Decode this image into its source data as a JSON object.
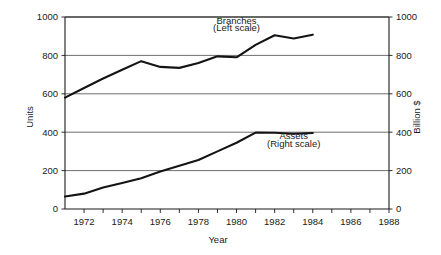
{
  "chart_data": {
    "type": "line",
    "title": "",
    "xlabel": "Year",
    "ylabel": "Units",
    "y2label": "Billion $",
    "grid": true,
    "legend_position": "inline-annotation",
    "xlim": [
      1971,
      1988
    ],
    "ylim": [
      0,
      1000
    ],
    "y2lim": [
      0,
      1000
    ],
    "xticks": [
      1972,
      1974,
      1976,
      1978,
      1980,
      1982,
      1984,
      1986,
      1988
    ],
    "xtick_labels": [
      "1972",
      "1974",
      "1976",
      "1978",
      "1980",
      "1982",
      "1984",
      "1986",
      "1988"
    ],
    "xtick_minor": [
      1971,
      1973,
      1975,
      1977,
      1979,
      1981,
      1983,
      1985,
      1987
    ],
    "yticks": [
      0,
      200,
      400,
      600,
      800,
      1000
    ],
    "ytick_labels": [
      "0",
      "200",
      "400",
      "600",
      "800",
      "1000"
    ],
    "y2ticks": [
      0,
      200,
      400,
      600,
      800,
      1000
    ],
    "y2tick_labels": [
      "0",
      "200",
      "400",
      "600",
      "800",
      "1000"
    ],
    "x": [
      1971,
      1972,
      1973,
      1974,
      1975,
      1976,
      1977,
      1978,
      1979,
      1980,
      1981,
      1982,
      1983,
      1984
    ],
    "series": [
      {
        "name": "Branches",
        "axis": "left",
        "annotation_line1": "Branches",
        "annotation_line2": "(Left scale)",
        "color": "#141414",
        "values": [
          580,
          630,
          680,
          725,
          770,
          740,
          735,
          760,
          795,
          790,
          855,
          905,
          888,
          908
        ]
      },
      {
        "name": "Assets",
        "axis": "right",
        "annotation_line1": "Assets",
        "annotation_line2": "(Right scale)",
        "color": "#141414",
        "values": [
          65,
          80,
          112,
          135,
          160,
          195,
          225,
          255,
          300,
          345,
          398,
          397,
          392,
          396
        ]
      }
    ],
    "annotations": [
      {
        "text": "Branches",
        "x": 1980,
        "y": 965
      },
      {
        "text": "(Left scale)",
        "x": 1980,
        "y": 925
      },
      {
        "text": "Assets",
        "x": 1983,
        "y": 365
      },
      {
        "text": "(Right scale)",
        "x": 1983,
        "y": 325
      }
    ]
  },
  "axes": {
    "left": {
      "title": "Units",
      "labels": [
        "1000",
        "800",
        "600",
        "400",
        "200",
        "0"
      ]
    },
    "right": {
      "title": "Billion $",
      "labels": [
        "1000",
        "800",
        "600",
        "400",
        "200",
        "0"
      ]
    },
    "bottom": {
      "title": "Year",
      "labels": [
        "1972",
        "1974",
        "1976",
        "1978",
        "1980",
        "1982",
        "1984",
        "1986",
        "1988"
      ]
    }
  },
  "colors": {
    "line": "#141414",
    "grid": "#4a4a4a",
    "axis": "#1a1a1a",
    "background": "#ffffff"
  }
}
